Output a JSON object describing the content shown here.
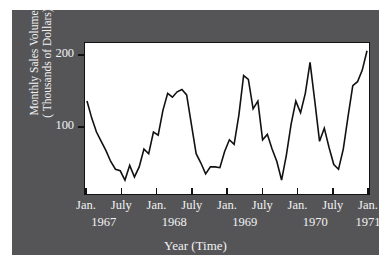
{
  "figure": {
    "background_color": "#555558",
    "page_color": "#ffffff",
    "plot_background_color": "#ffffff",
    "line_color": "#111111",
    "text_color": "#f2f2f2"
  },
  "axis": {
    "ylabel_line1": "Monthly Sales Volume",
    "ylabel_line2": "( Thousands of Dollars)",
    "xlabel": "Year (Time)",
    "ytick_labels": [
      "200",
      "100"
    ],
    "xtick_months": [
      "Jan.",
      "July",
      "Jan.",
      "July",
      "Jan.",
      "July",
      "Jan.",
      "July",
      "Jan."
    ],
    "xtick_years": [
      "1967",
      "",
      "1968",
      "",
      "1969",
      "",
      "1970",
      "",
      "1971"
    ],
    "year_label_positions": [
      {
        "label": "1967",
        "index": 0.5
      },
      {
        "label": "1968",
        "index": 2.5
      },
      {
        "label": "1969",
        "index": 4.5
      },
      {
        "label": "1970",
        "index": 6.5
      },
      {
        "label": "1971",
        "index": 8.0
      }
    ]
  },
  "chart_data": {
    "type": "line",
    "title": "",
    "xlabel": "Year (Time)",
    "ylabel": "Monthly Sales Volume (Thousands of Dollars)",
    "ylim": [
      20,
      215
    ],
    "yticks": [
      100,
      200
    ],
    "grid": false,
    "legend": false,
    "x_start": "1967-01",
    "x_end": "1970-12",
    "x_interval": "monthly",
    "xtick_interval_months": 6,
    "x": [
      "1967-01",
      "1967-02",
      "1967-03",
      "1967-04",
      "1967-05",
      "1967-06",
      "1967-07",
      "1967-08",
      "1967-09",
      "1967-10",
      "1967-11",
      "1967-12",
      "1968-01",
      "1968-02",
      "1968-03",
      "1968-04",
      "1968-05",
      "1968-06",
      "1968-07",
      "1968-08",
      "1968-09",
      "1968-10",
      "1968-11",
      "1968-12",
      "1969-01",
      "1969-02",
      "1969-03",
      "1969-04",
      "1969-05",
      "1969-06",
      "1969-07",
      "1969-08",
      "1969-09",
      "1969-10",
      "1969-11",
      "1969-12",
      "1970-01",
      "1970-02",
      "1970-03",
      "1970-04",
      "1970-05",
      "1970-06",
      "1970-07",
      "1970-08",
      "1970-09",
      "1970-10",
      "1970-11",
      "1970-12"
    ],
    "values": [
      140,
      118,
      100,
      88,
      76,
      62,
      52,
      50,
      38,
      57,
      42,
      55,
      78,
      72,
      100,
      96,
      128,
      150,
      145,
      152,
      155,
      148,
      110,
      72,
      60,
      46,
      55,
      55,
      54,
      75,
      90,
      84,
      122,
      173,
      168,
      130,
      140,
      90,
      97,
      78,
      62,
      38,
      70,
      110,
      140,
      125,
      150,
      190
    ],
    "series": [
      {
        "name": "Monthly Sales Volume",
        "values": [
          140,
          118,
          100,
          88,
          76,
          62,
          52,
          50,
          38,
          57,
          42,
          55,
          78,
          72,
          100,
          96,
          128,
          150,
          145,
          152,
          155,
          148,
          110,
          72,
          60,
          46,
          55,
          55,
          54,
          75,
          90,
          84,
          122,
          173,
          168,
          130,
          140,
          90,
          97,
          78,
          62,
          38,
          70,
          110,
          140,
          125,
          150,
          190
        ]
      }
    ],
    "points_plot_coords": [
      [
        0,
        140
      ],
      [
        1,
        118
      ],
      [
        2,
        100
      ],
      [
        3,
        88
      ],
      [
        4,
        76
      ],
      [
        5,
        62
      ],
      [
        6,
        52
      ],
      [
        7,
        50
      ],
      [
        8,
        38
      ],
      [
        9,
        57
      ],
      [
        10,
        42
      ],
      [
        11,
        55
      ],
      [
        12,
        78
      ],
      [
        13,
        72
      ],
      [
        14,
        100
      ],
      [
        15,
        96
      ],
      [
        16,
        128
      ],
      [
        17,
        150
      ],
      [
        18,
        145
      ],
      [
        19,
        152
      ],
      [
        20,
        155
      ],
      [
        21,
        148
      ],
      [
        22,
        110
      ],
      [
        23,
        72
      ],
      [
        24,
        60
      ],
      [
        25,
        46
      ],
      [
        26,
        55
      ],
      [
        27,
        55
      ],
      [
        28,
        54
      ],
      [
        29,
        75
      ],
      [
        30,
        90
      ],
      [
        31,
        84
      ],
      [
        32,
        122
      ],
      [
        33,
        173
      ],
      [
        34,
        168
      ],
      [
        35,
        130
      ],
      [
        36,
        140
      ],
      [
        37,
        90
      ],
      [
        38,
        97
      ],
      [
        39,
        78
      ],
      [
        40,
        62
      ],
      [
        41,
        38
      ],
      [
        42,
        70
      ],
      [
        43,
        110
      ],
      [
        44,
        140
      ],
      [
        45,
        125
      ],
      [
        46,
        150
      ],
      [
        47,
        190
      ],
      [
        48,
        140
      ],
      [
        49,
        88
      ],
      [
        50,
        105
      ],
      [
        51,
        80
      ],
      [
        52,
        58
      ],
      [
        53,
        52
      ],
      [
        54,
        78
      ],
      [
        55,
        120
      ],
      [
        56,
        160
      ],
      [
        57,
        165
      ],
      [
        58,
        180
      ],
      [
        59,
        205
      ]
    ]
  }
}
